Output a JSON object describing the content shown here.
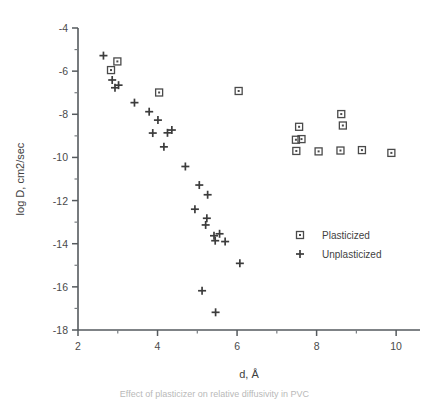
{
  "chart_data": {
    "type": "scatter",
    "title": "",
    "xlabel": "d, Å",
    "ylabel": "log D, cm2/sec",
    "xlim": [
      2,
      10.6
    ],
    "ylim": [
      -18,
      -4
    ],
    "xticks": [
      2,
      4,
      6,
      8,
      10
    ],
    "xtick_labels": [
      "2",
      "4",
      "6",
      "8",
      "10"
    ],
    "x_minor_ticks": [
      3,
      5,
      7,
      9
    ],
    "yticks": [
      -4,
      -6,
      -8,
      -10,
      -12,
      -14,
      -16,
      -18
    ],
    "ytick_labels": [
      "-4",
      "-6",
      "-8",
      "-10",
      "-12",
      "-14",
      "-16",
      "-18"
    ],
    "y_minor_ticks": [
      -5,
      -7,
      -9,
      -11,
      -13,
      -15,
      -17
    ],
    "grid": false,
    "legend_position": "right-lower",
    "series": [
      {
        "name": "Plasticized",
        "marker": "square",
        "points": [
          [
            2.83,
            -5.95
          ],
          [
            2.99,
            -5.55
          ],
          [
            4.04,
            -6.99
          ],
          [
            6.04,
            -6.92
          ],
          [
            7.56,
            -8.58
          ],
          [
            7.48,
            -9.18
          ],
          [
            7.62,
            -9.15
          ],
          [
            7.49,
            -9.7
          ],
          [
            8.05,
            -9.72
          ],
          [
            8.62,
            -7.99
          ],
          [
            8.66,
            -8.52
          ],
          [
            8.6,
            -9.68
          ],
          [
            9.14,
            -9.66
          ],
          [
            9.88,
            -9.79
          ]
        ]
      },
      {
        "name": "Unplasticized",
        "marker": "plus",
        "points": [
          [
            2.64,
            -5.28
          ],
          [
            2.86,
            -6.41
          ],
          [
            3.02,
            -6.65
          ],
          [
            2.93,
            -6.77
          ],
          [
            3.42,
            -7.46
          ],
          [
            3.79,
            -7.88
          ],
          [
            4.01,
            -8.27
          ],
          [
            3.88,
            -8.87
          ],
          [
            4.25,
            -8.86
          ],
          [
            4.36,
            -8.73
          ],
          [
            4.16,
            -9.51
          ],
          [
            4.7,
            -10.42
          ],
          [
            5.05,
            -11.28
          ],
          [
            5.26,
            -11.73
          ],
          [
            4.94,
            -12.4
          ],
          [
            5.24,
            -12.82
          ],
          [
            5.21,
            -13.13
          ],
          [
            5.42,
            -13.63
          ],
          [
            5.56,
            -13.54
          ],
          [
            5.45,
            -13.86
          ],
          [
            5.7,
            -13.9
          ],
          [
            6.07,
            -14.91
          ],
          [
            5.12,
            -16.18
          ],
          [
            5.46,
            -17.18
          ]
        ]
      }
    ],
    "legend": [
      {
        "label": "Plasticized",
        "marker": "square"
      },
      {
        "label": "Unplasticized",
        "marker": "plus"
      }
    ]
  },
  "caption": {
    "text": "Effect of plasticizer on relative diffusivity in PVC"
  },
  "colors": {
    "marker": "#4a4a4a",
    "axis": "#555a5e",
    "text": "#404040",
    "background": "#ffffff"
  }
}
